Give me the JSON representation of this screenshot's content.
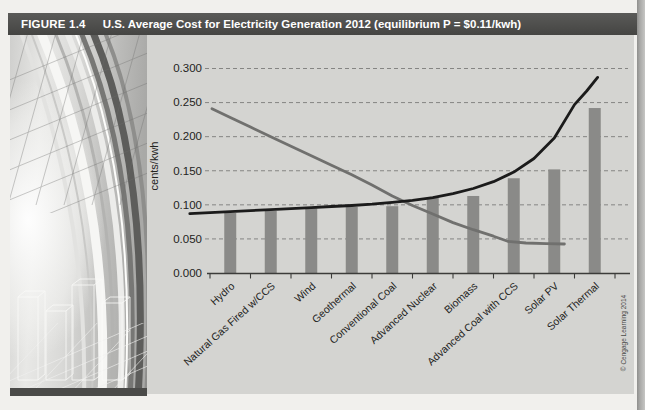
{
  "figure_header": {
    "label": "FIGURE 1.4",
    "title": "U.S. Average Cost for Electricity Generation 2012 (equilibrium P = $0.11/kwh)"
  },
  "credit": {
    "text": "© Cengage Learning 2014"
  },
  "colors": {
    "header_bar": "#4e4e4c",
    "header_text": "#ffffff",
    "paper": "#f1f0ed",
    "plot_bg": "#d4d4d1",
    "bar": "#8a8a88",
    "supply_line": "#1b1b1b",
    "demand_line": "#70706e",
    "gridline": "#787876",
    "axis": "#3c3c3a",
    "tick_label": "#232321",
    "credit_text": "#4a4a48"
  },
  "chart_data": {
    "type": "bar",
    "title": "U.S. Average Cost for Electricity Generation 2012",
    "subtitle": "equilibrium P = $0.11/kwh",
    "xlabel": "",
    "ylabel": "cents/kwh",
    "ylim": [
      0,
      0.3
    ],
    "ytick_labels": [
      "0.300",
      "0.250",
      "0.200",
      "0.150",
      "0.100",
      "0.050",
      "0.000"
    ],
    "grid": "horizontal dashed",
    "legend": "none",
    "categories": [
      "Hydro",
      "Natural Gas Fired w/CCS",
      "Wind",
      "Geothermal",
      "Conventional Coal",
      "Advanced Nuclear",
      "Biomass",
      "Advanced Coal with CCS",
      "Solar PV",
      "Solar Thermal"
    ],
    "series": [
      {
        "name": "average generation cost (bars, cents/kwh)",
        "type": "bar",
        "values": [
          0.088,
          0.091,
          0.095,
          0.097,
          0.098,
          0.11,
          0.113,
          0.139,
          0.152,
          0.242
        ]
      },
      {
        "name": "rising marginal cost (supply) curve",
        "type": "line",
        "color_key": "supply_line",
        "points": [
          [
            -0.5,
            0.087
          ],
          [
            0,
            0.0885
          ],
          [
            0.5,
            0.09
          ],
          [
            1,
            0.0915
          ],
          [
            1.5,
            0.093
          ],
          [
            2,
            0.0945
          ],
          [
            2.5,
            0.096
          ],
          [
            3,
            0.0975
          ],
          [
            3.5,
            0.099
          ],
          [
            4,
            0.101
          ],
          [
            4.5,
            0.1035
          ],
          [
            5,
            0.1065
          ],
          [
            5.5,
            0.1105
          ],
          [
            6,
            0.1165
          ],
          [
            6.5,
            0.124
          ],
          [
            7,
            0.134
          ],
          [
            7.5,
            0.148
          ],
          [
            8,
            0.168
          ],
          [
            8.5,
            0.198
          ],
          [
            9,
            0.247
          ],
          [
            9.3,
            0.267
          ],
          [
            9.57,
            0.287
          ]
        ]
      },
      {
        "name": "declining (demand) curve",
        "type": "line",
        "color_key": "demand_line",
        "points": [
          [
            0.05,
            0.241
          ],
          [
            0.5,
            0.228
          ],
          [
            1,
            0.214
          ],
          [
            1.5,
            0.2
          ],
          [
            2,
            0.186
          ],
          [
            2.5,
            0.172
          ],
          [
            3,
            0.158
          ],
          [
            3.5,
            0.144
          ],
          [
            4,
            0.129
          ],
          [
            4.5,
            0.113
          ],
          [
            5,
            0.099
          ],
          [
            5.5,
            0.0865
          ],
          [
            6,
            0.074
          ],
          [
            6.5,
            0.0635
          ],
          [
            7,
            0.054
          ],
          [
            7.35,
            0.0465
          ],
          [
            7.8,
            0.044
          ],
          [
            8.3,
            0.0432
          ],
          [
            8.75,
            0.0425
          ]
        ]
      }
    ]
  }
}
